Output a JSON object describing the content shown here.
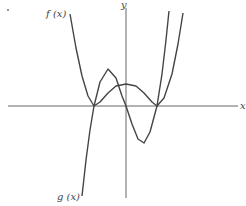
{
  "figure": {
    "labels": {
      "f": "f (x)",
      "g": "g (x)",
      "x_axis": "x",
      "y_axis": "y"
    },
    "colors": {
      "axis": "#666666",
      "curve": "#444444",
      "text": "#444444"
    },
    "axes": {
      "origin_px": [
        126,
        106
      ],
      "x_axis_px": [
        8,
        238
      ],
      "y_axis_px": [
        8,
        198
      ]
    },
    "curves": [
      {
        "name": "f(x)",
        "shape": "W-shaped even-degree polynomial, double roots touching x-axis",
        "points_px": [
          [
            70,
            14
          ],
          [
            76,
            48
          ],
          [
            82,
            76
          ],
          [
            88,
            96
          ],
          [
            94,
            106
          ],
          [
            100,
            102
          ],
          [
            108,
            93
          ],
          [
            116,
            86
          ],
          [
            126,
            84
          ],
          [
            136,
            86
          ],
          [
            144,
            93
          ],
          [
            152,
            102
          ],
          [
            157,
            106
          ],
          [
            164,
            98
          ],
          [
            172,
            74
          ],
          [
            178,
            44
          ],
          [
            183,
            13
          ]
        ]
      },
      {
        "name": "g(x)",
        "shape": "odd-degree polynomial crossing x-axis at three points",
        "points_px": [
          [
            82,
            196
          ],
          [
            86,
            160
          ],
          [
            90,
            130
          ],
          [
            94,
            106
          ],
          [
            100,
            82
          ],
          [
            108,
            69
          ],
          [
            116,
            78
          ],
          [
            122,
            96
          ],
          [
            126,
            106
          ],
          [
            132,
            124
          ],
          [
            138,
            139
          ],
          [
            144,
            143
          ],
          [
            150,
            132
          ],
          [
            157,
            106
          ],
          [
            162,
            74
          ],
          [
            166,
            40
          ],
          [
            169,
            11
          ]
        ]
      }
    ]
  }
}
